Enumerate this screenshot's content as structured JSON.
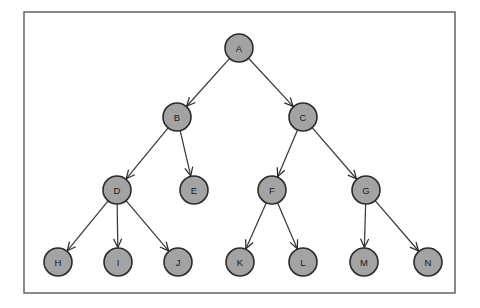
{
  "diagram": {
    "type": "directed-tree",
    "canvas": {
      "width": 480,
      "height": 308,
      "background": "#ffffff"
    },
    "frame": {
      "x": 24,
      "y": 12,
      "width": 431,
      "height": 281,
      "stroke": "#595959"
    },
    "node_style": {
      "radius": 14,
      "fill": "#a3a3a3",
      "stroke": "#2b2b2b"
    },
    "edge_style": {
      "stroke": "#3a3a3a",
      "arrow": "open-v"
    },
    "nodes": [
      {
        "id": "A",
        "label": "A",
        "x": 239,
        "y": 48,
        "level": 0
      },
      {
        "id": "B",
        "label": "B",
        "x": 177,
        "y": 117,
        "level": 1
      },
      {
        "id": "C",
        "label": "C",
        "x": 303,
        "y": 117,
        "level": 1
      },
      {
        "id": "D",
        "label": "D",
        "x": 117,
        "y": 190,
        "level": 2
      },
      {
        "id": "E",
        "label": "E",
        "x": 194,
        "y": 190,
        "level": 2
      },
      {
        "id": "F",
        "label": "F",
        "x": 272,
        "y": 190,
        "level": 2
      },
      {
        "id": "G",
        "label": "G",
        "x": 366,
        "y": 190,
        "level": 2
      },
      {
        "id": "H",
        "label": "H",
        "x": 58,
        "y": 262,
        "level": 3
      },
      {
        "id": "I",
        "label": "I",
        "x": 118,
        "y": 262,
        "level": 3
      },
      {
        "id": "J",
        "label": "J",
        "x": 178,
        "y": 262,
        "level": 3
      },
      {
        "id": "K",
        "label": "K",
        "x": 240,
        "y": 262,
        "level": 3
      },
      {
        "id": "L",
        "label": "L",
        "x": 303,
        "y": 262,
        "level": 3
      },
      {
        "id": "M",
        "label": "M",
        "x": 364,
        "y": 262,
        "level": 3
      },
      {
        "id": "N",
        "label": "N",
        "x": 428,
        "y": 262,
        "level": 3
      }
    ],
    "edges": [
      {
        "from": "A",
        "to": "B"
      },
      {
        "from": "A",
        "to": "C"
      },
      {
        "from": "B",
        "to": "D"
      },
      {
        "from": "B",
        "to": "E"
      },
      {
        "from": "C",
        "to": "F"
      },
      {
        "from": "C",
        "to": "G"
      },
      {
        "from": "D",
        "to": "H"
      },
      {
        "from": "D",
        "to": "I"
      },
      {
        "from": "D",
        "to": "J"
      },
      {
        "from": "F",
        "to": "K"
      },
      {
        "from": "F",
        "to": "L"
      },
      {
        "from": "G",
        "to": "M"
      },
      {
        "from": "G",
        "to": "N"
      }
    ]
  }
}
